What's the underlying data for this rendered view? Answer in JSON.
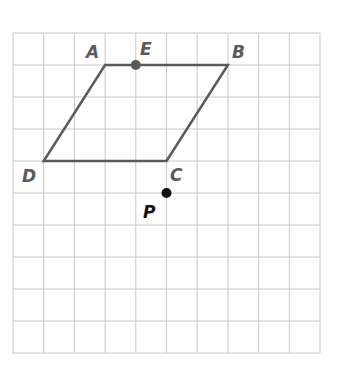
{
  "grid": {
    "origin_x": 13,
    "origin_y": 33,
    "cols": 10,
    "rows": 10,
    "cell_w": 30.7,
    "cell_h": 32,
    "line_color": "#c8c8c8"
  },
  "shape": {
    "name": "parallelogram ABCD",
    "stroke_color": "#5a5a5a",
    "vertices": [
      "A",
      "B",
      "C",
      "D"
    ]
  },
  "points": {
    "A": {
      "label": "A",
      "col": 3,
      "row": 1,
      "dot": false
    },
    "B": {
      "label": "B",
      "col": 7,
      "row": 1,
      "dot": false
    },
    "C": {
      "label": "C",
      "col": 5,
      "row": 4,
      "dot": false
    },
    "D": {
      "label": "D",
      "col": 1,
      "row": 4,
      "dot": false
    },
    "E": {
      "label": "E",
      "col": 4,
      "row": 1,
      "dot": true,
      "color": "#5a5a5a"
    },
    "P": {
      "label": "P",
      "col": 5,
      "row": 5,
      "dot": true,
      "color": "#111111"
    }
  },
  "labels": {
    "A": "A",
    "B": "B",
    "C": "C",
    "D": "D",
    "E": "E",
    "P": "P"
  }
}
